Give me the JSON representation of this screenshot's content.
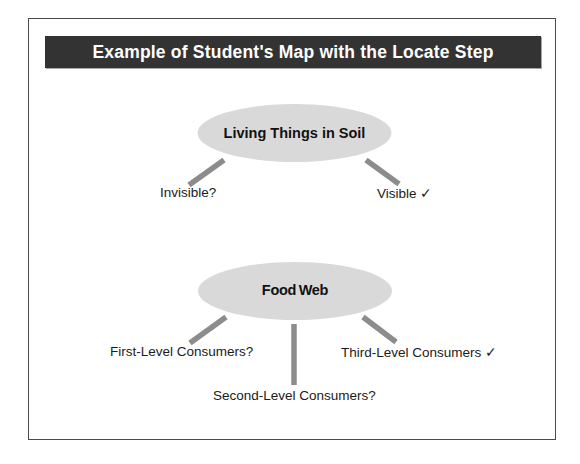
{
  "figure": {
    "title": "Example of Student's Map with the Locate Step",
    "title_bar_color": "#333333",
    "title_text_color": "#ffffff",
    "frame_border_color": "#4a4a4a",
    "background_color": "#ffffff",
    "node_fill_color": "#d9d9d9",
    "connector_color": "#8c8c8c",
    "label_text_color": "#1b1b1b"
  },
  "map": {
    "clusters": [
      {
        "id": "living-things-in-soil",
        "node_label": "Living Things in Soil",
        "branches": [
          {
            "id": "invisible",
            "label": "Invisible?",
            "marker": "question"
          },
          {
            "id": "visible",
            "label": "Visible ✓",
            "marker": "check"
          }
        ]
      },
      {
        "id": "food-web",
        "node_label": "Food Web",
        "branches": [
          {
            "id": "first-level",
            "label": "First-Level Consumers?",
            "marker": "question"
          },
          {
            "id": "second-level",
            "label": "Second-Level Consumers?",
            "marker": "question"
          },
          {
            "id": "third-level",
            "label": "Third-Level Consumers ✓",
            "marker": "check"
          }
        ]
      }
    ]
  }
}
